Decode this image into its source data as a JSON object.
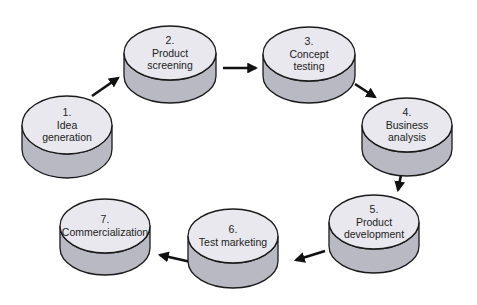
{
  "diagram": {
    "type": "process-cycle",
    "colors": {
      "top_fill": "#e8e8ee",
      "side_fill": "#b9b9c4",
      "stroke": "#1a1a1a",
      "arrow": "#111111"
    },
    "stages": [
      {
        "id": 1,
        "number": "1.",
        "lines": [
          "Idea",
          "generation"
        ],
        "cx": 67,
        "cy": 125,
        "rx": 45,
        "ry": 29,
        "h": 24
      },
      {
        "id": 2,
        "number": "2.",
        "lines": [
          "Product",
          "screening"
        ],
        "cx": 170,
        "cy": 53,
        "rx": 46,
        "ry": 27,
        "h": 23
      },
      {
        "id": 3,
        "number": "3.",
        "lines": [
          "Concept",
          "testing"
        ],
        "cx": 309,
        "cy": 54,
        "rx": 46,
        "ry": 27,
        "h": 22
      },
      {
        "id": 4,
        "number": "4.",
        "lines": [
          "Business",
          "analysis"
        ],
        "cx": 407,
        "cy": 125,
        "rx": 45,
        "ry": 27,
        "h": 24
      },
      {
        "id": 5,
        "number": "5.",
        "lines": [
          "Product",
          "development"
        ],
        "cx": 374,
        "cy": 222,
        "rx": 45,
        "ry": 27,
        "h": 24
      },
      {
        "id": 6,
        "number": "6.",
        "lines": [
          "Test marketing"
        ],
        "cx": 233,
        "cy": 236,
        "rx": 45,
        "ry": 27,
        "h": 25
      },
      {
        "id": 7,
        "number": "7.",
        "lines": [
          "Commercialization"
        ],
        "cx": 105,
        "cy": 226,
        "rx": 45,
        "ry": 27,
        "h": 22
      }
    ],
    "arrows": [
      {
        "from": 1,
        "to": 2,
        "x1": 92,
        "y1": 96,
        "x2": 118,
        "y2": 78
      },
      {
        "from": 2,
        "to": 3,
        "x1": 223,
        "y1": 68,
        "x2": 256,
        "y2": 68
      },
      {
        "from": 3,
        "to": 4,
        "x1": 355,
        "y1": 84,
        "x2": 375,
        "y2": 97
      },
      {
        "from": 4,
        "to": 5,
        "x1": 403,
        "y1": 165,
        "x2": 398,
        "y2": 190
      },
      {
        "from": 5,
        "to": 6,
        "x1": 325,
        "y1": 251,
        "x2": 296,
        "y2": 260
      },
      {
        "from": 6,
        "to": 7,
        "x1": 191,
        "y1": 262,
        "x2": 160,
        "y2": 255
      }
    ]
  }
}
